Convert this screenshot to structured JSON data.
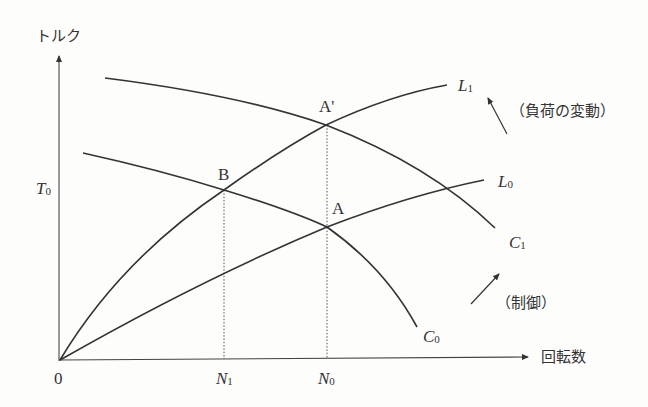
{
  "axes": {
    "y_label": "トルク",
    "x_label": "回転数",
    "origin_label": "0",
    "y_tick": {
      "main": "T",
      "sub": "0"
    },
    "x_ticks": [
      {
        "main": "N",
        "sub": "1"
      },
      {
        "main": "N",
        "sub": "0"
      }
    ]
  },
  "curves": {
    "C1": {
      "main": "C",
      "sub": "1"
    },
    "C0": {
      "main": "C",
      "sub": "0"
    },
    "L1": {
      "main": "L",
      "sub": "1"
    },
    "L0": {
      "main": "L",
      "sub": "0"
    }
  },
  "points": {
    "A": "A",
    "A_prime": "A'",
    "B": "B"
  },
  "annotations": {
    "load_change": "（負荷の変動）",
    "control": "（制御）"
  }
}
